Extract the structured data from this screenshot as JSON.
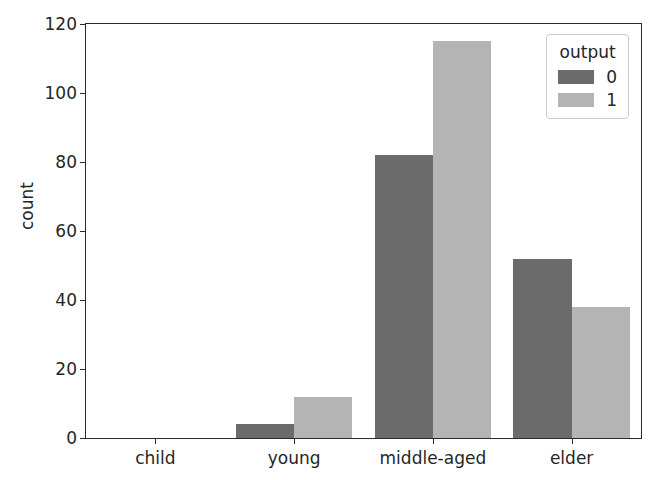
{
  "chart_data": {
    "type": "bar",
    "title": "",
    "xlabel": "",
    "ylabel": "count",
    "categories": [
      "child",
      "young",
      "middle-aged",
      "elder"
    ],
    "series": [
      {
        "name": "0",
        "color": "#6b6b6b",
        "values": [
          0,
          4,
          82,
          52
        ]
      },
      {
        "name": "1",
        "color": "#b4b4b4",
        "values": [
          0,
          12,
          115,
          38
        ]
      }
    ],
    "legend": {
      "title": "output",
      "position": "upper right",
      "entries": [
        "0",
        "1"
      ]
    },
    "ylim": [
      0,
      120
    ],
    "yticks": [
      0,
      20,
      40,
      60,
      80,
      100,
      120
    ],
    "ytick_labels": [
      "0",
      "20",
      "40",
      "60",
      "80",
      "100",
      "120"
    ],
    "xtick_labels": [
      "child",
      "young",
      "middle-aged",
      "elder"
    ],
    "grid": false,
    "bar_mode": "grouped"
  }
}
